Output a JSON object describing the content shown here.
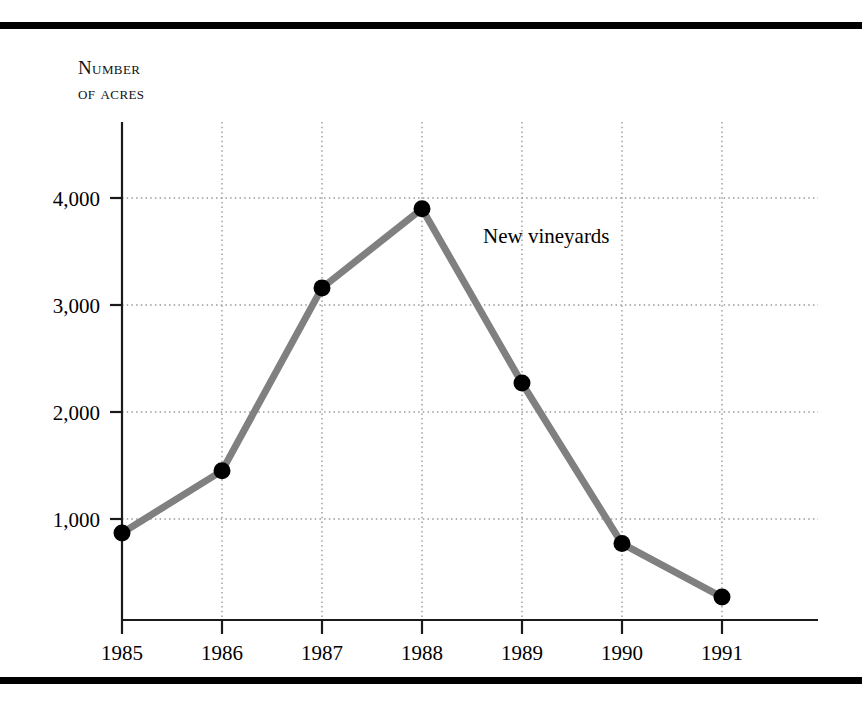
{
  "figure": {
    "name": "new-vineyards-line-chart",
    "axis_title_line1": "Number",
    "axis_title_line2": "of acres",
    "axis_title": "Number\nof acres",
    "series_annotation": "New vineyards",
    "rule_color": "#000000",
    "line_color": "#808080",
    "marker_color": "#000000",
    "grid_color": "#9a9a9a",
    "axis_color": "#1a1a1a"
  },
  "chart_data": {
    "type": "line",
    "title": "",
    "xlabel": "",
    "ylabel": "Number of acres",
    "categories": [
      "1985",
      "1986",
      "1987",
      "1988",
      "1989",
      "1990",
      "1991"
    ],
    "series": [
      {
        "name": "New vineyards",
        "values": [
          870,
          1450,
          3160,
          3900,
          2270,
          770,
          270
        ]
      }
    ],
    "ytick_labels": [
      "1,000",
      "2,000",
      "3,000",
      "4,000"
    ],
    "ytick_values": [
      1000,
      2000,
      3000,
      4000
    ],
    "ylim": [
      0,
      4100
    ],
    "xlim": [
      "1985",
      "1991"
    ],
    "grid": true,
    "grid_style": "dotted",
    "legend": "none",
    "annotations": [
      {
        "text": "New vineyards",
        "x": "1988",
        "y": 3550
      }
    ],
    "markers": true
  }
}
